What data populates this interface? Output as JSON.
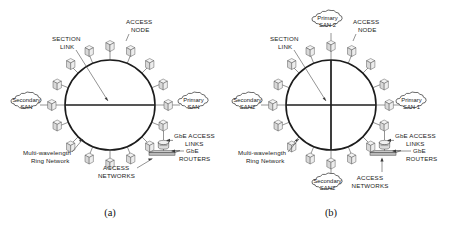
{
  "figure": {
    "background_color": "#ffffff",
    "ink_color": "#1a1a1a",
    "panels": [
      {
        "id": "a",
        "caption": "(a)",
        "ring_label": "Multi-wavelength Ring Network",
        "labels": {
          "section_link": "SECTION LINK",
          "section_link_line1": "SECTION",
          "section_link_line2": "LINK",
          "access_node": "ACCESS NODE",
          "access_node_line1": "ACCESS",
          "access_node_line2": "NODE",
          "gbe_access_links_line1": "GbE ACCESS",
          "gbe_access_links_line2": "LINKS",
          "gbe_routers_line1": "GbE",
          "gbe_routers_line2": "ROUTERS",
          "access_networks_line1": "ACCESS",
          "access_networks_line2": "NETWORKS",
          "ring_line1": "Multi-wavelength",
          "ring_line2": "Ring Network"
        },
        "clouds": [
          {
            "name": "secondary-san",
            "line1": "Secondary",
            "line2": "SAN",
            "position": "left"
          },
          {
            "name": "primary-san",
            "line1": "Primary",
            "line2": "SAN",
            "position": "right"
          }
        ],
        "chords": [
          "horizontal"
        ],
        "access_node_count": 16
      },
      {
        "id": "b",
        "caption": "(b)",
        "ring_label": "Multi-wavelength Ring Network",
        "labels": {
          "section_link": "SECTION LINK",
          "section_link_line1": "SECTION",
          "section_link_line2": "LINK",
          "access_node": "ACCESS NODE",
          "access_node_line1": "ACCESS",
          "access_node_line2": "NODE",
          "gbe_access_links_line1": "GbE ACCESS",
          "gbe_access_links_line2": "LINKS",
          "gbe_routers_line1": "GbE",
          "gbe_routers_line2": "ROUTERS",
          "access_networks_line1": "ACCESS",
          "access_networks_line2": "NETWORKS",
          "ring_line1": "Multi-wavelength",
          "ring_line2": "Ring Network"
        },
        "clouds": [
          {
            "name": "primary-san-2",
            "line1": "Primary",
            "line2": "SAN 2",
            "position": "top"
          },
          {
            "name": "secondary-san2-left",
            "line1": "Secondary",
            "line2": "SAN2",
            "position": "left"
          },
          {
            "name": "primary-san-1",
            "line1": "Primary",
            "line2": "SAN 1",
            "position": "right"
          },
          {
            "name": "secondary-san2-bottom",
            "line1": "Secondary",
            "line2": "SAN2",
            "position": "bottom"
          }
        ],
        "chords": [
          "horizontal",
          "vertical"
        ],
        "access_node_count": 16
      }
    ]
  }
}
